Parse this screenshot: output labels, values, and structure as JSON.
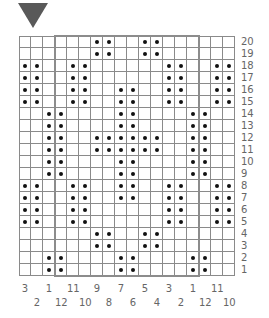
{
  "title_marker": "down-triangle",
  "colors": {
    "grid_line": "#8a8a8a",
    "repeat_border": "#8c8c8c",
    "dot": "#111111",
    "triangle": "#595959",
    "label": "#666666"
  },
  "chart": {
    "columns": 18,
    "rows": 20,
    "row_labels": [
      "20",
      "19",
      "18",
      "17",
      "16",
      "15",
      "14",
      "13",
      "12",
      "11",
      "10",
      "9",
      "8",
      "7",
      "6",
      "5",
      "4",
      "3",
      "2",
      "1"
    ],
    "col_labels": [
      "3",
      "2",
      "1",
      "12",
      "11",
      "10",
      "9",
      "8",
      "7",
      "6",
      "5",
      "4",
      "3",
      "2",
      "1",
      "12",
      "11",
      "10"
    ],
    "repeat_columns": {
      "start": 3,
      "end": 14
    },
    "dots_by_row": {
      "20": [
        6,
        7,
        10,
        11
      ],
      "19": [
        6,
        7,
        10,
        11
      ],
      "18": [
        0,
        1,
        4,
        5,
        12,
        13,
        16,
        17
      ],
      "17": [
        0,
        1,
        4,
        5,
        12,
        13,
        16,
        17
      ],
      "16": [
        0,
        1,
        4,
        5,
        8,
        9,
        12,
        13,
        16,
        17
      ],
      "15": [
        0,
        1,
        4,
        5,
        8,
        9,
        12,
        13,
        16,
        17
      ],
      "14": [
        2,
        3,
        8,
        9,
        14,
        15
      ],
      "13": [
        2,
        3,
        8,
        9,
        14,
        15
      ],
      "12": [
        2,
        3,
        6,
        7,
        8,
        9,
        10,
        11,
        14,
        15
      ],
      "11": [
        2,
        3,
        6,
        7,
        8,
        9,
        10,
        11,
        14,
        15
      ],
      "10": [
        2,
        3,
        8,
        9,
        14,
        15
      ],
      "9": [
        2,
        3,
        8,
        9,
        14,
        15
      ],
      "8": [
        0,
        1,
        4,
        5,
        8,
        9,
        12,
        13,
        16,
        17
      ],
      "7": [
        0,
        1,
        4,
        5,
        8,
        9,
        12,
        13,
        16,
        17
      ],
      "6": [
        0,
        1,
        4,
        5,
        12,
        13,
        16,
        17
      ],
      "5": [
        0,
        1,
        4,
        5,
        12,
        13,
        16,
        17
      ],
      "4": [
        6,
        7,
        10,
        11
      ],
      "3": [
        6,
        7,
        10,
        11
      ],
      "2": [
        2,
        3,
        8,
        9,
        14,
        15
      ],
      "1": [
        2,
        3,
        8,
        9,
        14,
        15
      ]
    }
  }
}
